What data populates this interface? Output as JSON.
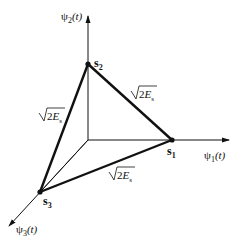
{
  "diagram": {
    "type": "signal-constellation-3d",
    "axes": [
      {
        "id": "psi1",
        "label": "ψ1(t)",
        "base": "ψ",
        "sub": "1",
        "arg": "(t)"
      },
      {
        "id": "psi2",
        "label": "ψ2(t)",
        "base": "ψ",
        "sub": "2",
        "arg": "(t)"
      },
      {
        "id": "psi3",
        "label": "ψ3(t)",
        "base": "ψ",
        "sub": "3",
        "arg": "(t)"
      }
    ],
    "points": [
      {
        "id": "s1",
        "label": "s1",
        "base": "s",
        "sub": "1"
      },
      {
        "id": "s2",
        "label": "s2",
        "base": "s",
        "sub": "2"
      },
      {
        "id": "s3",
        "label": "s3",
        "base": "s",
        "sub": "3"
      }
    ],
    "edges": [
      {
        "from": "s2",
        "to": "s1",
        "label": "√2Es",
        "radicand": "2",
        "symbol": "E",
        "sub": "s"
      },
      {
        "from": "s2",
        "to": "s3",
        "label": "√2Es",
        "radicand": "2",
        "symbol": "E",
        "sub": "s"
      },
      {
        "from": "s3",
        "to": "s1",
        "label": "√2Es",
        "radicand": "2",
        "symbol": "E",
        "sub": "s"
      }
    ],
    "colors": {
      "line": "#111111",
      "background": "#ffffff"
    }
  }
}
